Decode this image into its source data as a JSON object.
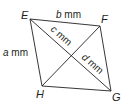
{
  "diagram": {
    "type": "quadrilateral-with-diagonals",
    "vertices": {
      "E": {
        "label": "E",
        "x": 30,
        "y": 19
      },
      "F": {
        "label": "F",
        "x": 100,
        "y": 26
      },
      "G": {
        "label": "G",
        "x": 111,
        "y": 91
      },
      "H": {
        "label": "H",
        "x": 42,
        "y": 86
      }
    },
    "side_labels": {
      "EF": {
        "var": "b",
        "unit": " mm"
      },
      "EH": {
        "var": "a",
        "unit": " mm"
      }
    },
    "diagonal_labels": {
      "EO": {
        "var": "c",
        "unit": " mm"
      },
      "OG": {
        "var": "d",
        "unit": " mm"
      }
    },
    "colors": {
      "stroke": "#231f20",
      "text": "#231f20",
      "background": "#ffffff"
    }
  }
}
